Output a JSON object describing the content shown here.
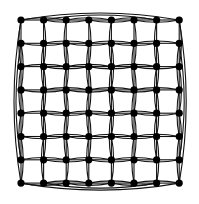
{
  "diagram": {
    "type": "grid-graph",
    "rows": 8,
    "cols": 8,
    "node_count": 64,
    "origin": [
      21,
      20
    ],
    "spacing": [
      22.6,
      23.3
    ],
    "node_radius": 3.6,
    "node_color": "#000000",
    "edge_color": "#111111",
    "background": "#ffffff",
    "edges": {
      "adjacent_neighbors": true,
      "distance_two_curved": true,
      "boundary_wraparound_arcs": true
    }
  }
}
